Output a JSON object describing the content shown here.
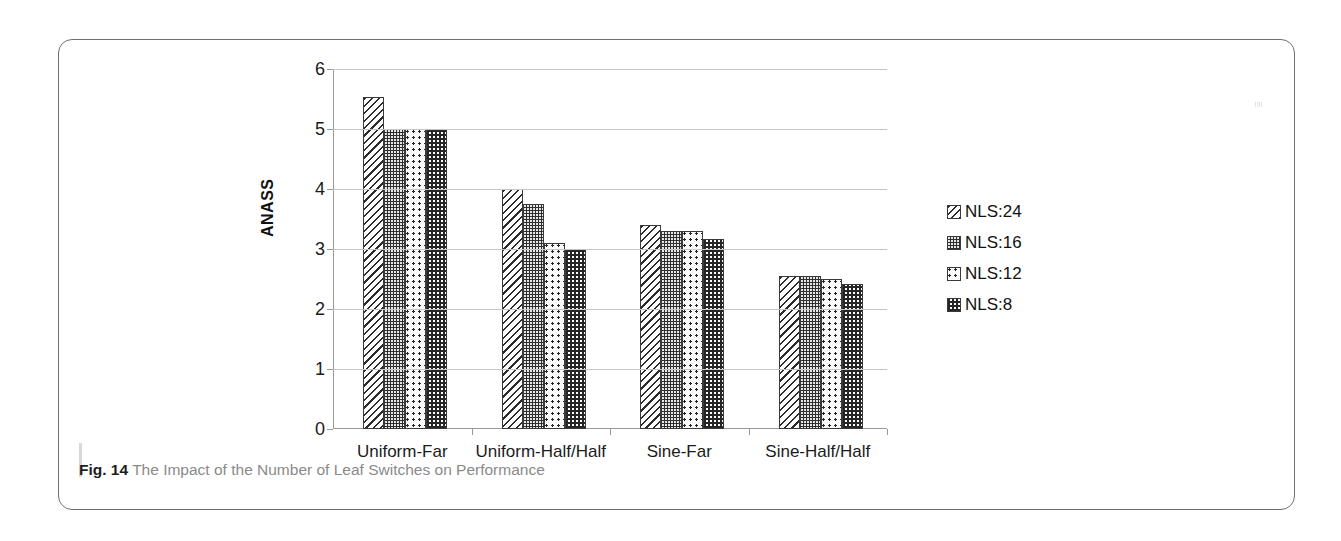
{
  "figure": {
    "caption_label": "Fig. 14",
    "caption_text": " The Impact of the Number of Leaf Switches on Performance"
  },
  "chart_data": {
    "type": "bar",
    "title": "",
    "xlabel": "",
    "ylabel": "ANASS",
    "ylim": [
      0,
      6
    ],
    "ytick_values": [
      0,
      1,
      2,
      3,
      4,
      5,
      6
    ],
    "ytick_labels": [
      "0",
      "1",
      "2",
      "3",
      "4",
      "5",
      "6"
    ],
    "grid": true,
    "legend_position": "right",
    "categories": [
      "Uniform-Far",
      "Uniform-Half/Half",
      "Sine-Far",
      "Sine-Half/Half"
    ],
    "series": [
      {
        "name": "NLS:24",
        "pattern": "diagonal-hatch",
        "values": [
          5.53,
          4.0,
          3.4,
          2.55
        ]
      },
      {
        "name": "NLS:16",
        "pattern": "dense-dots",
        "values": [
          5.0,
          3.75,
          3.3,
          2.55
        ]
      },
      {
        "name": "NLS:12",
        "pattern": "sparse-dots",
        "values": [
          5.0,
          3.1,
          3.3,
          2.5
        ]
      },
      {
        "name": "NLS:8",
        "pattern": "checker",
        "values": [
          5.0,
          3.0,
          3.17,
          2.42
        ]
      }
    ]
  },
  "colors": {
    "grid": "#c6c6c6",
    "axis": "#9a9a9a",
    "text": "#1b1b1b",
    "caption": "#8a8a8a",
    "frame": "#6f6f6f"
  }
}
